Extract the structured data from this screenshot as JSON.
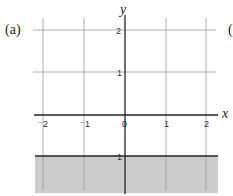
{
  "panel_label": "(a)",
  "right_edge_label": "(",
  "axes": {
    "x_label": "x",
    "y_label": "y",
    "x_ticks": [
      "⁻2",
      "⁻1",
      "0",
      "1",
      "2"
    ],
    "y_ticks": [
      "2",
      "1",
      "⁻1"
    ]
  },
  "region": {
    "description": "y < -1 shaded",
    "boundary": "y = -1",
    "fill_color": "#cccccc",
    "boundary_style": "solid"
  },
  "colors": {
    "grid": "#999999",
    "axis": "#222222",
    "shade": "#cccccc"
  }
}
